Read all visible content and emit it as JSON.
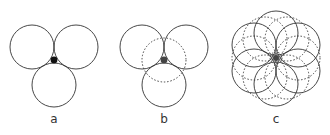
{
  "panels": [
    {
      "label": "a",
      "description": "three tangent circles with filled interstice"
    },
    {
      "label": "b",
      "description": "three tangent circles with dashed inscribed circle"
    },
    {
      "label": "c",
      "description": "six solid circles with dashed circles around central interstice"
    }
  ],
  "colors": {
    "stroke": "#333333",
    "fill": "#111111",
    "background": "#ffffff"
  }
}
